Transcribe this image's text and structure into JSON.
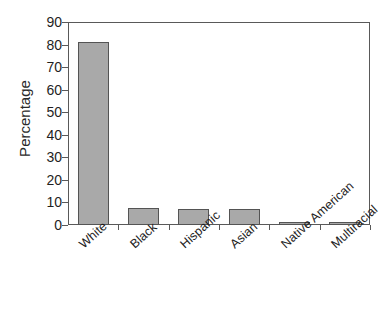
{
  "chart_data": {
    "type": "bar",
    "title": "",
    "subtitle": "",
    "xlabel": "",
    "ylabel": "Percentage",
    "categories": [
      "White",
      "Black",
      "Hispanic",
      "Asian",
      "Native American",
      "Multiracial"
    ],
    "values": [
      81,
      7.5,
      7,
      7,
      1.5,
      1.5
    ],
    "ylim": [
      0,
      90
    ],
    "ytick_labels": [
      "0",
      "10",
      "20",
      "30",
      "40",
      "50",
      "60",
      "70",
      "80",
      "90"
    ],
    "ytick_values": [
      0,
      10,
      20,
      30,
      40,
      50,
      60,
      70,
      80,
      90
    ],
    "grid": false,
    "legend": null,
    "bar_color": "#a9a9a9",
    "bar_edge_color": "#545454",
    "axis_color": "#595959",
    "background_color": "#ffffff"
  },
  "axes": {
    "y_title": "Percentage"
  }
}
